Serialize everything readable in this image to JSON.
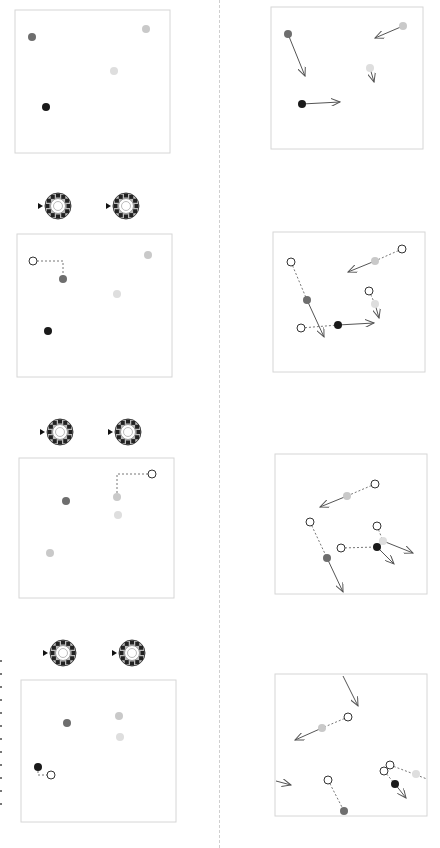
{
  "figure": {
    "colors": {
      "black": "#1a1a1a",
      "dark_gray": "#6e6e6e",
      "light_gray": "#c9c9c9",
      "pale_gray": "#dedede",
      "panel_border": "#d6d6d6",
      "arrow": "#555555",
      "dashed": "#777777"
    },
    "left_column": {
      "panels": [
        {
          "box": [
            15,
            10,
            155,
            143
          ],
          "dials": [],
          "dots": [
            {
              "x": 32,
              "y": 37,
              "fill": "dark_gray"
            },
            {
              "x": 146,
              "y": 29,
              "fill": "light_gray"
            },
            {
              "x": 114,
              "y": 71,
              "fill": "pale_gray"
            },
            {
              "x": 46,
              "y": 107,
              "fill": "black"
            }
          ],
          "ghosts": [],
          "dashed_paths": []
        },
        {
          "box": [
            17,
            234,
            155,
            143
          ],
          "dials": [
            {
              "x": 58,
              "y": 206
            },
            {
              "x": 126,
              "y": 206
            }
          ],
          "dots": [
            {
              "x": 63,
              "y": 279,
              "fill": "dark_gray"
            },
            {
              "x": 148,
              "y": 255,
              "fill": "light_gray"
            },
            {
              "x": 117,
              "y": 294,
              "fill": "pale_gray"
            },
            {
              "x": 48,
              "y": 331,
              "fill": "black"
            }
          ],
          "ghosts": [
            {
              "x": 33,
              "y": 261
            }
          ],
          "dashed_paths": [
            [
              [
                33,
                261
              ],
              [
                63,
                261
              ],
              [
                63,
                279
              ]
            ]
          ]
        },
        {
          "box": [
            19,
            458,
            155,
            140
          ],
          "dials": [
            {
              "x": 60,
              "y": 432
            },
            {
              "x": 128,
              "y": 432
            }
          ],
          "dots": [
            {
              "x": 66,
              "y": 501,
              "fill": "dark_gray"
            },
            {
              "x": 117,
              "y": 497,
              "fill": "light_gray"
            },
            {
              "x": 118,
              "y": 515,
              "fill": "pale_gray"
            },
            {
              "x": 50,
              "y": 553,
              "fill": "light_gray"
            }
          ],
          "ghosts": [
            {
              "x": 152,
              "y": 474
            }
          ],
          "dashed_paths": [
            [
              [
                152,
                474
              ],
              [
                117,
                474
              ],
              [
                117,
                497
              ]
            ]
          ]
        },
        {
          "box": [
            21,
            680,
            155,
            142
          ],
          "dials": [
            {
              "x": 63,
              "y": 653
            },
            {
              "x": 132,
              "y": 653
            }
          ],
          "dots": [
            {
              "x": 67,
              "y": 723,
              "fill": "dark_gray"
            },
            {
              "x": 119,
              "y": 716,
              "fill": "light_gray"
            },
            {
              "x": 120,
              "y": 737,
              "fill": "pale_gray"
            },
            {
              "x": 38,
              "y": 767,
              "fill": "black"
            }
          ],
          "ghosts": [
            {
              "x": 51,
              "y": 775
            }
          ],
          "dashed_paths": [
            [
              [
                38,
                767
              ],
              [
                38,
                775
              ],
              [
                51,
                775
              ]
            ]
          ]
        }
      ]
    },
    "right_column": {
      "panels": [
        {
          "box": [
            271,
            7,
            152,
            142
          ],
          "dots": [
            {
              "x": 288,
              "y": 34,
              "fill": "dark_gray"
            },
            {
              "x": 403,
              "y": 26,
              "fill": "light_gray"
            },
            {
              "x": 370,
              "y": 68,
              "fill": "pale_gray"
            },
            {
              "x": 302,
              "y": 104,
              "fill": "black"
            }
          ],
          "ghosts": [],
          "dashed": [],
          "arrows": [
            {
              "from": [
                288,
                34
              ],
              "to": [
                305,
                76
              ]
            },
            {
              "from": [
                403,
                26
              ],
              "to": [
                375,
                38
              ]
            },
            {
              "from": [
                370,
                68
              ],
              "to": [
                374,
                82
              ]
            },
            {
              "from": [
                302,
                104
              ],
              "to": [
                340,
                102
              ]
            }
          ]
        },
        {
          "box": [
            273,
            232,
            152,
            140
          ],
          "dots": [
            {
              "x": 307,
              "y": 300,
              "fill": "dark_gray"
            },
            {
              "x": 375,
              "y": 261,
              "fill": "light_gray"
            },
            {
              "x": 375,
              "y": 304,
              "fill": "pale_gray"
            },
            {
              "x": 338,
              "y": 325,
              "fill": "black"
            }
          ],
          "ghosts": [
            {
              "x": 291,
              "y": 262
            },
            {
              "x": 402,
              "y": 249
            },
            {
              "x": 369,
              "y": 291
            },
            {
              "x": 301,
              "y": 328
            }
          ],
          "dashed": [
            {
              "from": [
                291,
                262
              ],
              "to": [
                307,
                300
              ]
            },
            {
              "from": [
                402,
                249
              ],
              "to": [
                375,
                261
              ]
            },
            {
              "from": [
                369,
                291
              ],
              "to": [
                375,
                304
              ]
            },
            {
              "from": [
                301,
                328
              ],
              "to": [
                338,
                325
              ]
            }
          ],
          "arrows": [
            {
              "from": [
                307,
                300
              ],
              "to": [
                324,
                337
              ]
            },
            {
              "from": [
                375,
                261
              ],
              "to": [
                348,
                272
              ]
            },
            {
              "from": [
                375,
                304
              ],
              "to": [
                379,
                318
              ]
            },
            {
              "from": [
                338,
                325
              ],
              "to": [
                374,
                323
              ]
            }
          ]
        },
        {
          "box": [
            275,
            454,
            152,
            140
          ],
          "dots": [
            {
              "x": 327,
              "y": 558,
              "fill": "dark_gray"
            },
            {
              "x": 347,
              "y": 496,
              "fill": "light_gray"
            },
            {
              "x": 383,
              "y": 541,
              "fill": "pale_gray"
            },
            {
              "x": 377,
              "y": 547,
              "fill": "black"
            }
          ],
          "ghosts": [
            {
              "x": 310,
              "y": 522
            },
            {
              "x": 375,
              "y": 484
            },
            {
              "x": 377,
              "y": 526
            },
            {
              "x": 341,
              "y": 548
            }
          ],
          "dashed": [
            {
              "from": [
                310,
                522
              ],
              "to": [
                327,
                558
              ]
            },
            {
              "from": [
                375,
                484
              ],
              "to": [
                347,
                496
              ]
            },
            {
              "from": [
                377,
                526
              ],
              "to": [
                383,
                541
              ]
            },
            {
              "from": [
                341,
                548
              ],
              "to": [
                377,
                547
              ]
            }
          ],
          "arrows": [
            {
              "from": [
                327,
                558
              ],
              "to": [
                343,
                592
              ]
            },
            {
              "from": [
                347,
                496
              ],
              "to": [
                320,
                507
              ]
            },
            {
              "from": [
                383,
                541
              ],
              "to": [
                413,
                553
              ]
            },
            {
              "from": [
                377,
                547
              ],
              "to": [
                394,
                564
              ]
            }
          ]
        },
        {
          "box": [
            275,
            674,
            152,
            142
          ],
          "dots": [
            {
              "x": 344,
              "y": 811,
              "fill": "dark_gray"
            },
            {
              "x": 322,
              "y": 728,
              "fill": "light_gray"
            },
            {
              "x": 416,
              "y": 774,
              "fill": "pale_gray"
            },
            {
              "x": 395,
              "y": 784,
              "fill": "black"
            }
          ],
          "ghosts": [
            {
              "x": 328,
              "y": 780
            },
            {
              "x": 348,
              "y": 717
            },
            {
              "x": 390,
              "y": 765
            },
            {
              "x": 384,
              "y": 771
            }
          ],
          "dashed": [
            {
              "from": [
                328,
                780
              ],
              "to": [
                344,
                811
              ]
            },
            {
              "from": [
                348,
                717
              ],
              "to": [
                322,
                728
              ]
            },
            {
              "from": [
                390,
                765
              ],
              "to": [
                427,
                779
              ]
            },
            {
              "from": [
                384,
                771
              ],
              "to": [
                395,
                784
              ]
            }
          ],
          "arrows": [
            {
              "from": [
                343,
                676
              ],
              "to": [
                358,
                706
              ]
            },
            {
              "from": [
                322,
                728
              ],
              "to": [
                295,
                740
              ]
            },
            {
              "from": [
                276,
                781
              ],
              "to": [
                291,
                785
              ]
            },
            {
              "from": [
                395,
                784
              ],
              "to": [
                406,
                798
              ]
            }
          ]
        }
      ]
    }
  }
}
